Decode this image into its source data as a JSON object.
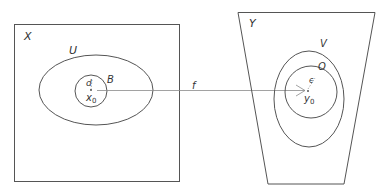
{
  "diagram": {
    "left_space": {
      "label": "X"
    },
    "open_set_U": {
      "label": "U"
    },
    "ball_B": {
      "label": "B",
      "radius_label": "d",
      "center_label": "x",
      "center_sub": "0"
    },
    "map": {
      "label": "f"
    },
    "right_space": {
      "label": "Y"
    },
    "open_set_V": {
      "label": "V"
    },
    "ball_O": {
      "label": "O",
      "radius_label": "ϵ",
      "center_label": "y",
      "center_sub": "0"
    }
  },
  "colors": {
    "stroke": "#555555",
    "text": "#333333",
    "background": "#ffffff"
  }
}
